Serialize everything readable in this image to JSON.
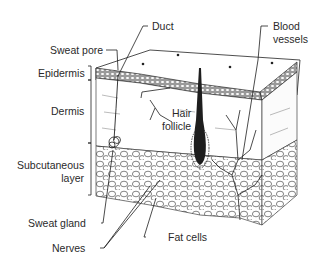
{
  "diagram": {
    "labels": {
      "duct": "Duct",
      "blood_vessels_1": "Blood",
      "blood_vessels_2": "vessels",
      "sweat_pore": "Sweat pore",
      "epidermis": "Epidermis",
      "dermis": "Dermis",
      "hair_follicle_1": "Hair",
      "hair_follicle_2": "follicle",
      "subcutaneous_1": "Subcutaneous",
      "subcutaneous_2": "layer",
      "sweat_gland": "Sweat gland",
      "nerves": "Nerves",
      "fat_cells": "Fat cells"
    },
    "layers": [
      "Epidermis",
      "Dermis",
      "Subcutaneous layer"
    ],
    "colors": {
      "ink": "#1e1e1e",
      "text": "#2a2a2a",
      "background": "#ffffff",
      "shade": "#d8d8d8"
    }
  }
}
